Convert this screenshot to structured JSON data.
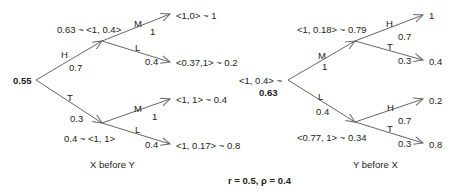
{
  "caption": "r = 0.5, ρ = 0.4",
  "left_tree": {
    "title": "X before Y",
    "root_value": "0.55",
    "upper": {
      "edge_label": "H",
      "edge_prob": "0.7",
      "node_label": "0.63 ~ <1, 0.4>",
      "children": [
        {
          "edge_label": "M",
          "edge_prob": "1",
          "leaf": "<1,0> ~ 1"
        },
        {
          "edge_label": "L",
          "edge_prob": "0.4",
          "leaf": "<0.37,1> ~ 0.2"
        }
      ]
    },
    "lower": {
      "edge_label": "T",
      "edge_prob": "0.3",
      "node_label": "0.4 ~ <1, 1>",
      "children": [
        {
          "edge_label": "M",
          "edge_prob": "1",
          "leaf": "<1, 1> ~ 0.4"
        },
        {
          "edge_label": "L",
          "edge_prob": "0.4",
          "leaf": "<1, 0.17> ~ 0.8"
        }
      ]
    }
  },
  "right_tree": {
    "title": "Y before X",
    "root_label": "<1, 0.4> ~",
    "root_value": "0.63",
    "upper": {
      "edge_label": "M",
      "edge_prob": "1",
      "node_label": "<1, 0.18> ~ 0.79",
      "children": [
        {
          "edge_label": "H",
          "edge_prob": "0.7",
          "leaf": "1"
        },
        {
          "edge_label": "T",
          "edge_prob": "0.3",
          "leaf": "0.4"
        }
      ]
    },
    "lower": {
      "edge_label": "L",
      "edge_prob": "0.4",
      "node_label": "<0.77, 1> ~ 0.34",
      "children": [
        {
          "edge_label": "H",
          "edge_prob": "0.7",
          "leaf": "0.2"
        },
        {
          "edge_label": "T",
          "edge_prob": "0.3",
          "leaf": "0.8"
        }
      ]
    }
  },
  "colors": {
    "line": "#666666",
    "text": "#222222"
  }
}
